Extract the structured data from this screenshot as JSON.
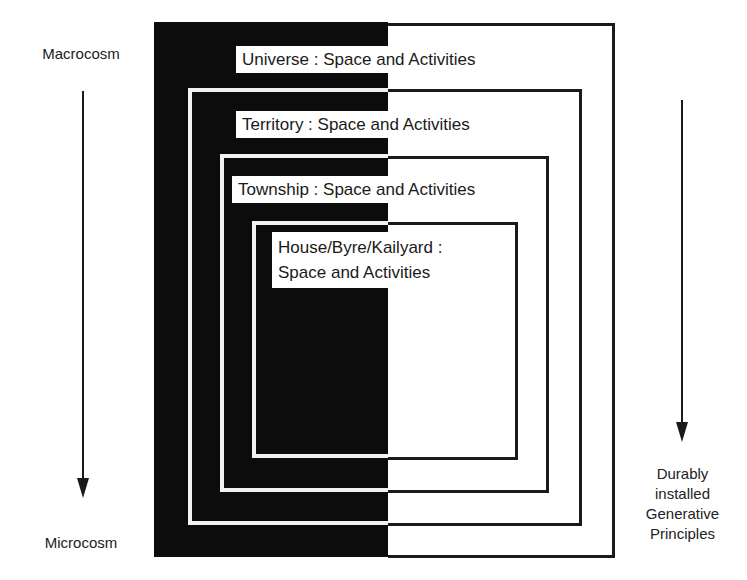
{
  "diagram": {
    "left_axis": {
      "top_label": "Macrocosm",
      "bottom_label": "Microcosm",
      "arrow": "down-arrow"
    },
    "right_axis": {
      "label_lines": [
        "Durably",
        "installed",
        "Generative",
        "Principles"
      ],
      "arrow": "down-arrow"
    },
    "levels": [
      {
        "name": "Universe",
        "label": "Universe : Space and Activities"
      },
      {
        "name": "Territory",
        "label": "Territory : Space and Activities"
      },
      {
        "name": "Township",
        "label": "Township : Space and Activities"
      },
      {
        "name": "House/Byre/Kailyard",
        "label_line1": "House/Byre/Kailyard :",
        "label_line2": "Space and Activities"
      }
    ],
    "colors": {
      "left_half": "#0c0c0c",
      "right_half": "#ffffff",
      "lines": "#1a1a1a"
    }
  }
}
